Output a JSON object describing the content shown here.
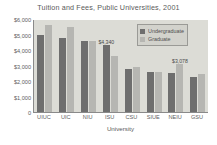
{
  "chart_data": {
    "type": "bar",
    "title": "Tuition and Fees, Public Universities, 2001",
    "xlabel": "University",
    "ylabel": "",
    "categories": [
      "UIUC",
      "UIC",
      "NIU",
      "ISU",
      "CSU",
      "SIUE",
      "NEIU",
      "GSU"
    ],
    "series": [
      {
        "name": "Undergraduate",
        "color": "#6e6e6e",
        "values": [
          5000,
          4790,
          4600,
          4340,
          2750,
          2550,
          2500,
          2250
        ]
      },
      {
        "name": "Graduate",
        "color": "#b6b6b2",
        "values": [
          5620,
          5480,
          4560,
          3600,
          2900,
          2560,
          3078,
          2460
        ]
      }
    ],
    "ylim": [
      0,
      6000
    ],
    "yticks": [
      "$6,000",
      "$5,000",
      "$4,000",
      "$3,000",
      "$2,000",
      "$1,000",
      "0"
    ],
    "ytick_values": [
      6000,
      5000,
      4000,
      3000,
      2000,
      1000,
      0
    ],
    "grid": false,
    "legend_position": "top-right",
    "annotations": [
      {
        "text": "$4,340",
        "series": "Undergraduate",
        "category": "ISU",
        "value": 4340
      },
      {
        "text": "$3,078",
        "series": "Graduate",
        "category": "NEIU",
        "value": 3078
      }
    ]
  },
  "legend": {
    "items": [
      {
        "label": "Undergraduate"
      },
      {
        "label": "Graduate"
      }
    ]
  }
}
